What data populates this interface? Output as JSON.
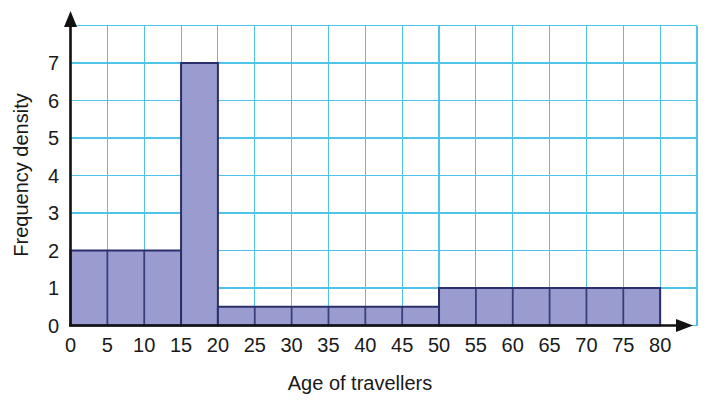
{
  "chart_data": {
    "type": "bar",
    "title": "",
    "xlabel": "Age of travellers",
    "ylabel": "Frequency density",
    "xlim": [
      0,
      85
    ],
    "ylim": [
      0,
      8
    ],
    "grid": true,
    "legend": "none",
    "x_tick_labels": [
      "0",
      "5",
      "10",
      "15",
      "20",
      "25",
      "30",
      "35",
      "40",
      "45",
      "50",
      "55",
      "60",
      "65",
      "70",
      "75",
      "80"
    ],
    "x_tick_values": [
      0,
      5,
      10,
      15,
      20,
      25,
      30,
      35,
      40,
      45,
      50,
      55,
      60,
      65,
      70,
      75,
      80
    ],
    "y_tick_labels": [
      "0",
      "1",
      "2",
      "3",
      "4",
      "5",
      "6",
      "7"
    ],
    "y_tick_values": [
      0,
      1,
      2,
      3,
      4,
      5,
      6,
      7
    ],
    "x_grid_step": 5,
    "y_grid_step": 1,
    "bars": [
      {
        "x0": 0,
        "x1": 15,
        "height": 2.0,
        "label": "0-15",
        "frequency": 30
      },
      {
        "x0": 15,
        "x1": 20,
        "height": 7.0,
        "label": "15-20",
        "frequency": 35
      },
      {
        "x0": 20,
        "x1": 50,
        "height": 0.5,
        "label": "20-50",
        "frequency": 15
      },
      {
        "x0": 50,
        "x1": 80,
        "height": 1.0,
        "label": "50-80",
        "frequency": 30
      }
    ],
    "bar_internal_dividers": [
      5,
      10,
      25,
      30,
      35,
      40,
      45,
      55,
      60,
      65,
      70,
      75
    ],
    "colors": {
      "bar_fill": "#9a9cd0",
      "bar_edge": "#2a2f6b",
      "grid": "#4fc3e8",
      "axis": "#111111",
      "text": "#1a1a1a",
      "background": "#ffffff"
    }
  },
  "figure": {
    "name": "histogram-age-of-travellers",
    "y_axis_title": "Frequency density",
    "x_axis_title": "Age of travellers"
  }
}
